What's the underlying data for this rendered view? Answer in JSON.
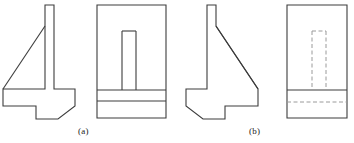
{
  "sheet": {
    "title": "Orthographic views of an angle bracket with web rib",
    "background_color": "#ffffff",
    "line_color": "#3c3c3c",
    "hidden_line_color": "#9a9a9a",
    "line_width": 1.1,
    "hidden_line_width": 1.0,
    "hidden_dash_pattern": "4,2.5"
  },
  "captions": [
    {
      "id": "a",
      "text": "(a)",
      "x": 78,
      "y": 126
    },
    {
      "id": "b",
      "text": "(b)",
      "x": 249,
      "y": 126
    }
  ],
  "figures": [
    {
      "id": "a",
      "label": "(a)",
      "views": [
        {
          "id": "a-side-view",
          "name": "side-view",
          "description": "Profile view: vertical wall at right, triangular rib sloping down to the left, stepped base foot",
          "outline": "M 45,5 L 54,5 L 54,89 L 75,89 L 75,106 L 58,119 L 36,119 L 36,106 L 3,106 L 3,89 L 45,89 L 45,26 Z",
          "internal_lines": [
            {
              "id": "a-rib-hypotenuse",
              "name": "rib-hypotenuse",
              "d": "M 45,26 L 3,89"
            }
          ]
        },
        {
          "id": "a-front-view",
          "name": "front-view",
          "description": "Front view rectangle with visible rib slot and two base bands",
          "outline": "M 97,5 L 166,5 L 166,118 L 97,118 Z",
          "internal_lines": [
            {
              "id": "a-rib-left-edge",
              "name": "rib-left-edge",
              "d": "M 122,31 L 122,90"
            },
            {
              "id": "a-rib-right-edge",
              "name": "rib-right-edge",
              "d": "M 136,31 L 136,90"
            },
            {
              "id": "a-rib-top-edge",
              "name": "rib-top-edge",
              "d": "M 122,31 L 136,31"
            },
            {
              "id": "a-base-line-upper",
              "name": "base-line-upper",
              "d": "M 97,90 L 166,90"
            },
            {
              "id": "a-base-line-lower",
              "name": "base-line-lower",
              "d": "M 97,101 L 166,101"
            }
          ]
        }
      ]
    },
    {
      "id": "b",
      "label": "(b)",
      "views": [
        {
          "id": "b-side-view",
          "name": "side-view",
          "description": "Mirrored profile view: vertical wall at left, triangular rib sloping down to the right, stepped base foot",
          "outline": "M 207,5 L 216,5 L 216,26 L 258,89 L 258,106 L 225,106 L 225,119 L 203,119 L 186,106 L 186,89 L 207,89 Z",
          "internal_lines": [
            {
              "id": "b-rib-hypotenuse",
              "name": "rib-hypotenuse",
              "d": "M 216,26 L 258,89"
            }
          ]
        },
        {
          "id": "b-front-view",
          "name": "front-view",
          "description": "Front view rectangle with hidden rib slot (dashed) and a hidden base line (dashed)",
          "outline": "M 287,5 L 347,5 L 347,118 L 287,118 Z",
          "solid_lines": [
            {
              "id": "b-base-line-solid",
              "name": "base-line-solid",
              "d": "M 287,90 L 347,90"
            }
          ],
          "hidden_lines": [
            {
              "id": "b-rib-left-edge-hidden",
              "name": "rib-left-edge-hidden",
              "d": "M 312,31 L 312,90"
            },
            {
              "id": "b-rib-right-edge-hidden",
              "name": "rib-right-edge-hidden",
              "d": "M 326,31 L 326,90"
            },
            {
              "id": "b-rib-top-edge-hidden",
              "name": "rib-top-edge-hidden",
              "d": "M 312,31 L 326,31"
            },
            {
              "id": "b-base-line-hidden",
              "name": "base-line-hidden",
              "d": "M 287,102 L 347,102"
            }
          ]
        }
      ]
    }
  ]
}
